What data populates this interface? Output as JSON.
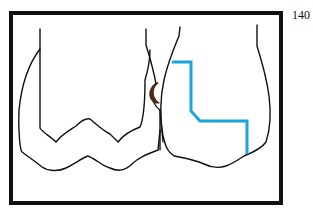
{
  "figure": {
    "page_number": "140",
    "frame": {
      "x": 11,
      "y": 13,
      "width": 270,
      "height": 190,
      "stroke": "#111111",
      "stroke_width": 4
    },
    "colors": {
      "outline": "#111111",
      "preparation_line": "#1ba3dc",
      "decay_mark": "#4a2a18",
      "background": "#ffffff"
    },
    "left_tooth": {
      "label": "Mesial tooth outline with inner crown contour"
    },
    "right_tooth": {
      "label": "Adjacent tooth with stepped preparation outline"
    },
    "decay_mark": {
      "label": "Proximal lesion (crescent)"
    }
  }
}
